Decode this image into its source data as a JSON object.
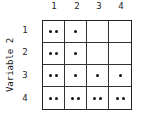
{
  "axes": {
    "y_title": "Variable 2",
    "columns": [
      "1",
      "2",
      "3",
      "4"
    ],
    "rows": [
      "1",
      "2",
      "3",
      "4"
    ]
  },
  "cells": [
    [
      2,
      1,
      0,
      0
    ],
    [
      2,
      1,
      0,
      0
    ],
    [
      2,
      1,
      1,
      1
    ],
    [
      2,
      2,
      2,
      2
    ]
  ]
}
